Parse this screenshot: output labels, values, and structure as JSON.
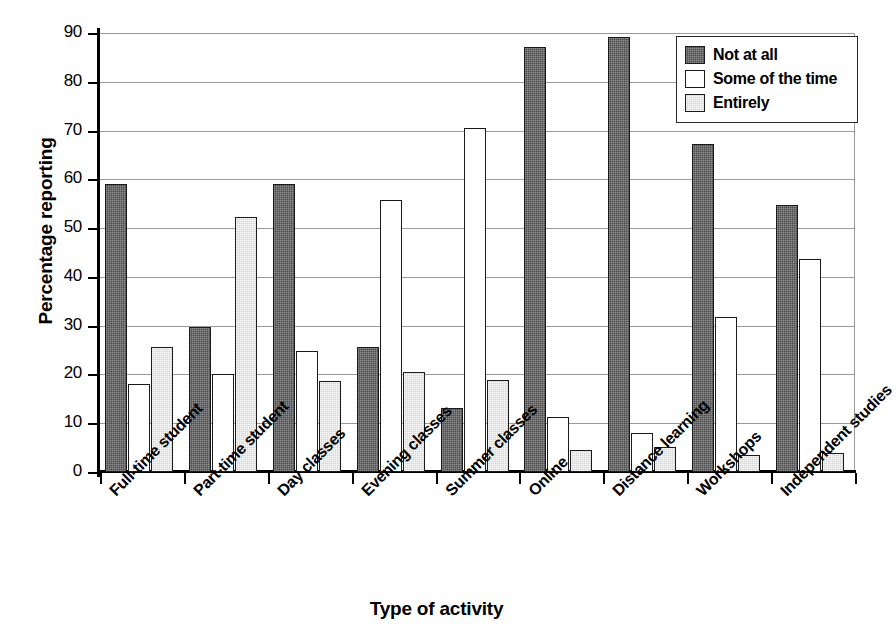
{
  "chart_data": {
    "type": "bar",
    "title": "",
    "xlabel": "Type of activity",
    "ylabel": "Percentage reporting",
    "ylim": [
      0,
      90
    ],
    "yticks": [
      0,
      10,
      20,
      30,
      40,
      50,
      60,
      70,
      80,
      90
    ],
    "ytick_labels": [
      "0",
      "10",
      "20",
      "30",
      "40",
      "50",
      "60",
      "70",
      "80",
      "90"
    ],
    "grid": "horizontal",
    "legend_position": "top-right",
    "categories": [
      "Full-time student",
      "Part-time student",
      "Day classes",
      "Evening classes",
      "Summer classes",
      "Online",
      "Distance learning",
      "Workshops",
      "Independent studies"
    ],
    "series": [
      {
        "name": "Not at all",
        "color": "#4a4a4a",
        "values": [
          59.0,
          29.8,
          59.0,
          25.7,
          13.2,
          87.2,
          89.2,
          67.2,
          54.8
        ]
      },
      {
        "name": "Some of the time",
        "color": "#ffffff",
        "values": [
          18.0,
          20.0,
          24.8,
          55.7,
          70.5,
          11.2,
          8.1,
          31.8,
          43.7
        ]
      },
      {
        "name": "Entirely",
        "color": "#d3d3d3",
        "values": [
          25.7,
          52.3,
          18.6,
          20.6,
          18.8,
          4.5,
          5.2,
          3.4,
          4.0
        ]
      }
    ]
  }
}
